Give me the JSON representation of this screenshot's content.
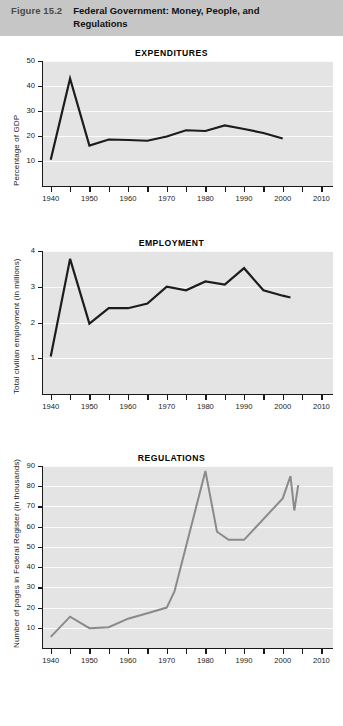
{
  "header": {
    "figure_number": "Figure 15.2",
    "title": "Federal Government: Money, People, and Regulations",
    "band_color": "#c6c6c6"
  },
  "palette": {
    "plot_background": "#e4e4e4",
    "gridline": "#fbfbfb",
    "axis": "#1a1a1a",
    "line_dark": "#1c1c1c",
    "line_gray": "#8a8a8a"
  },
  "charts": [
    {
      "id": "expenditures",
      "title": "EXPENDITURES",
      "ylabel": "Percentage of GDP",
      "xlabel": "",
      "line_color": "#1c1c1c"
    },
    {
      "id": "employment",
      "title": "EMPLOYMENT",
      "ylabel": "Total civilian employment (in millions)",
      "xlabel": "",
      "line_color": "#1c1c1c"
    },
    {
      "id": "regulations",
      "title": "REGULATIONS",
      "ylabel": "Number of pages in Federal Register (in thousands)",
      "xlabel": "",
      "line_color": "#8a8a8a"
    }
  ],
  "chart_data": [
    {
      "type": "line",
      "title": "EXPENDITURES",
      "xlabel": "",
      "ylabel": "Percentage of GDP",
      "xlim": [
        1938,
        2013
      ],
      "ylim": [
        0,
        50
      ],
      "yticks": [
        10,
        20,
        30,
        40,
        50
      ],
      "ytick_labels": [
        "10",
        "20",
        "30",
        "40",
        "50"
      ],
      "xticks": [
        1940,
        1945,
        1950,
        1955,
        1960,
        1965,
        1970,
        1975,
        1980,
        1985,
        1990,
        1995,
        2000,
        2005,
        2010
      ],
      "xtick_labels": [
        "1940",
        "",
        "1950",
        "",
        "1960",
        "",
        "1970",
        "",
        "1980",
        "",
        "1990",
        "",
        "2000",
        "",
        "2010"
      ],
      "grid": "horizontal",
      "legend": "none",
      "series": [
        {
          "name": "Federal expenditures as percentage of GDP",
          "x": [
            1940,
            1945,
            1950,
            1955,
            1960,
            1965,
            1970,
            1975,
            1980,
            1985,
            1990,
            1995,
            2000
          ],
          "values": [
            10.5,
            43.0,
            16.2,
            18.6,
            18.4,
            18.1,
            19.8,
            22.3,
            22.0,
            24.2,
            22.8,
            21.2,
            19.0
          ]
        }
      ]
    },
    {
      "type": "line",
      "title": "EMPLOYMENT",
      "xlabel": "",
      "ylabel": "Total civilian employment (in millions)",
      "xlim": [
        1938,
        2013
      ],
      "ylim": [
        0,
        4
      ],
      "yticks": [
        1,
        2,
        3,
        4
      ],
      "ytick_labels": [
        "1",
        "2",
        "3",
        "4"
      ],
      "xticks": [
        1940,
        1945,
        1950,
        1955,
        1960,
        1965,
        1970,
        1975,
        1980,
        1985,
        1990,
        1995,
        2000,
        2005,
        2010
      ],
      "xtick_labels": [
        "1940",
        "",
        "1950",
        "",
        "1960",
        "",
        "1970",
        "",
        "1980",
        "",
        "1990",
        "",
        "2000",
        "",
        "2010"
      ],
      "grid": "horizontal",
      "legend": "none",
      "series": [
        {
          "name": "Total federal civilian employment (millions)",
          "x": [
            1940,
            1945,
            1950,
            1955,
            1960,
            1965,
            1970,
            1975,
            1980,
            1985,
            1990,
            1995,
            2000,
            2002
          ],
          "values": [
            1.05,
            3.78,
            1.97,
            2.4,
            2.4,
            2.53,
            3.0,
            2.9,
            3.15,
            3.06,
            3.52,
            2.9,
            2.75,
            2.7
          ]
        }
      ]
    },
    {
      "type": "line",
      "title": "REGULATIONS",
      "xlabel": "",
      "ylabel": "Number of pages in Federal Register (in thousands)",
      "xlim": [
        1938,
        2013
      ],
      "ylim": [
        0,
        90
      ],
      "yticks": [
        10,
        20,
        30,
        40,
        50,
        60,
        70,
        80,
        90
      ],
      "ytick_labels": [
        "10",
        "20",
        "30",
        "40",
        "50",
        "60",
        "70",
        "80",
        "90"
      ],
      "xticks": [
        1940,
        1945,
        1950,
        1955,
        1960,
        1965,
        1970,
        1975,
        1980,
        1985,
        1990,
        1995,
        2000,
        2005,
        2010
      ],
      "xtick_labels": [
        "1940",
        "",
        "1950",
        "",
        "1960",
        "",
        "1970",
        "",
        "1980",
        "",
        "1990",
        "",
        "2000",
        "",
        "2010"
      ],
      "grid": "horizontal",
      "legend": "none",
      "series": [
        {
          "name": "Pages published in the Federal Register (thousands)",
          "x": [
            1940,
            1945,
            1950,
            1955,
            1960,
            1965,
            1970,
            1972,
            1980,
            1983,
            1986,
            1990,
            2000,
            2002,
            2003,
            2004
          ],
          "values": [
            5.5,
            15.5,
            9.8,
            10.3,
            14.5,
            17.2,
            20.0,
            28.0,
            87.5,
            57.5,
            53.5,
            53.5,
            74.0,
            85.0,
            68.0,
            80.5
          ]
        }
      ]
    }
  ]
}
